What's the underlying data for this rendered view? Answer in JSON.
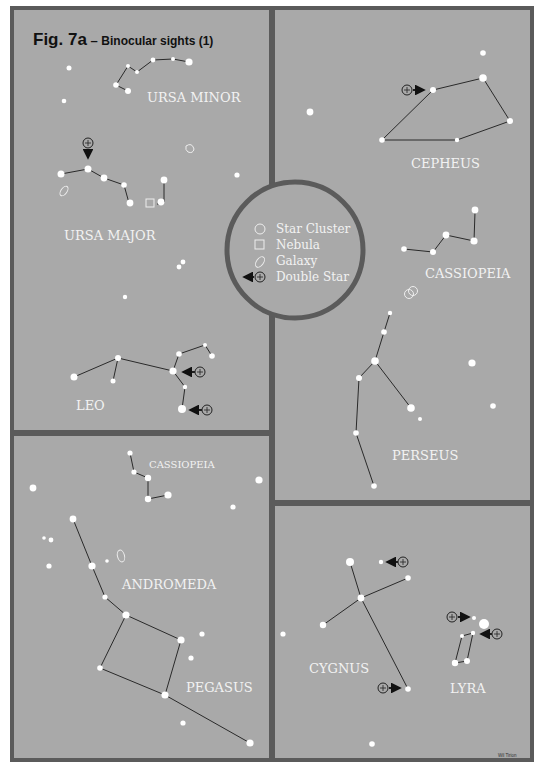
{
  "title": {
    "main": "Fig. 7a",
    "dash": " – ",
    "sub": "Binocular sights (1)"
  },
  "colors": {
    "background": "#a9a9a9",
    "frame": "#5b5b5b",
    "star": "#ffffff",
    "line": "#2a2a2a",
    "label": "#f2f2f2"
  },
  "legend": {
    "items": [
      {
        "icon": "star-cluster-icon",
        "label": "Star Cluster"
      },
      {
        "icon": "nebula-icon",
        "label": "Nebula"
      },
      {
        "icon": "galaxy-icon",
        "label": "Galaxy"
      },
      {
        "icon": "double-star-icon",
        "label": "Double Star"
      }
    ]
  },
  "panels": [
    {
      "id": "panel-top-left",
      "constellations": [
        "URSA MINOR",
        "URSA MAJOR",
        "LEO"
      ]
    },
    {
      "id": "panel-top-right",
      "constellations": [
        "CEPHEUS",
        "CASSIOPEIA",
        "PERSEUS"
      ]
    },
    {
      "id": "panel-bottom-left",
      "constellations": [
        "CASSIOPEIA",
        "ANDROMEDA",
        "PEGASUS"
      ]
    },
    {
      "id": "panel-bottom-right",
      "constellations": [
        "CYGNUS",
        "LYRA"
      ]
    }
  ],
  "labels": {
    "ursa_minor": "URSA MINOR",
    "ursa_major": "URSA MAJOR",
    "leo": "LEO",
    "cepheus": "CEPHEUS",
    "cassiopeia": "CASSIOPEIA",
    "perseus": "PERSEUS",
    "cassiopeia_small": "CASSIOPEIA",
    "andromeda": "ANDROMEDA",
    "pegasus": "PEGASUS",
    "cygnus": "CYGNUS",
    "lyra": "LYRA",
    "credit": "Wil Tirion"
  }
}
